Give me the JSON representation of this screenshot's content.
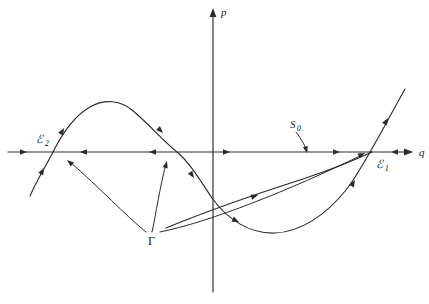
{
  "figure": {
    "name": "phase-portrait-diagram",
    "background_color": "#ffffff",
    "ink_color": "#2b2b2b",
    "width": 429,
    "height": 304
  },
  "axes": {
    "vertical": {
      "label": "p",
      "label_x": 221,
      "label_y": 16,
      "x": 213,
      "y_top": 10,
      "y_bottom": 292,
      "arrow_at_top": true
    },
    "horizontal": {
      "label": "q",
      "label_x": 419,
      "label_y": 156,
      "y": 152,
      "x_left": 8,
      "x_right": 412,
      "arrow_at_right": true
    }
  },
  "labels": [
    {
      "name": "equilibrium-a2",
      "base": "ℰ",
      "sub": "2",
      "x": 36,
      "y": 143
    },
    {
      "name": "equilibrium-a1",
      "base": "ℰ",
      "sub": "1",
      "x": 376,
      "y": 168
    },
    {
      "name": "separatrix-s0",
      "base": "S",
      "sub": "0",
      "x": 290,
      "y": 128
    },
    {
      "name": "gamma-curve-label",
      "base": "Γ",
      "sub": "",
      "x": 148,
      "y": 245
    }
  ],
  "curves": [
    {
      "name": "cubic-nullcline-curve",
      "description": "S-shaped cubic-like curve crossing the q-axis near A2 and A1",
      "path": "M 30,196 C 38,178 46,166 53,152 C 62,134 74,116 90,107 C 104,99 120,100 132,110 C 148,123 162,140 177,152 C 190,163 200,180 212,198 C 228,220 250,234 275,233 C 300,232 325,216 346,190 C 362,170 382,130 405,89"
    },
    {
      "name": "gamma-trajectory-curve",
      "description": "trajectory Gamma rising from lower-left to A1 region",
      "path": "M 166,228 C 200,214 250,196 300,180 C 330,170 355,160 372,152"
    }
  ],
  "flow_arrows": [
    {
      "name": "axis-flow-arrow-1",
      "x": 27,
      "y": 152,
      "angle": 0
    },
    {
      "name": "axis-flow-arrow-2",
      "x": 80,
      "y": 152,
      "angle": 180
    },
    {
      "name": "axis-flow-arrow-3",
      "x": 149,
      "y": 152,
      "angle": 180
    },
    {
      "name": "axis-flow-arrow-4",
      "x": 230,
      "y": 152,
      "angle": 0
    },
    {
      "name": "axis-flow-arrow-5",
      "x": 340,
      "y": 152,
      "angle": 0
    },
    {
      "name": "axis-flow-arrow-6",
      "x": 391,
      "y": 152,
      "angle": 180
    },
    {
      "name": "curve-flow-arrow-1",
      "x": 44,
      "y": 168,
      "angle": 298
    },
    {
      "name": "curve-flow-arrow-2",
      "x": 64,
      "y": 128,
      "angle": 299
    },
    {
      "name": "curve-flow-arrow-3",
      "x": 163,
      "y": 133,
      "angle": 45
    },
    {
      "name": "curve-flow-arrow-4",
      "x": 194,
      "y": 178,
      "angle": 56
    },
    {
      "name": "curve-flow-arrow-5",
      "x": 239,
      "y": 222,
      "angle": 24
    },
    {
      "name": "curve-flow-arrow-6",
      "x": 355,
      "y": 180,
      "angle": 300
    },
    {
      "name": "curve-flow-arrow-7",
      "x": 388,
      "y": 118,
      "angle": 300
    },
    {
      "name": "gamma-flow-arrow-1",
      "x": 258,
      "y": 195,
      "angle": 342
    }
  ],
  "pointers": [
    {
      "name": "gamma-pointer-left",
      "path": "M 146,232 C 125,215 100,188 70,162",
      "arrow": {
        "x": 67,
        "y": 160,
        "angle": 220
      }
    },
    {
      "name": "gamma-pointer-up",
      "path": "M 152,232 C 156,214 160,186 166,164",
      "arrow": {
        "x": 167,
        "y": 161,
        "angle": 285
      }
    },
    {
      "name": "gamma-pointer-right",
      "path": "M 160,232 C 210,222 290,190 362,155",
      "arrow": {
        "x": 365,
        "y": 153,
        "angle": 335
      }
    },
    {
      "name": "s0-pointer",
      "path": "M 296,132 C 302,140 305,146 307,151",
      "arrow": {
        "x": 307,
        "y": 153,
        "angle": 75
      }
    }
  ]
}
